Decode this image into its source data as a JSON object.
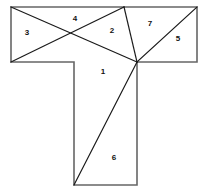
{
  "figure": {
    "width": 208,
    "height": 194,
    "background_color": "#ffffff",
    "outline_color": "#666666",
    "cut_line_color": "#1a1a1a",
    "label_color": "#111111"
  },
  "outline": {
    "name": "t-shape-outline",
    "points": "11,7 197,7 197,62 137,62 137,185 74,185 74,62 11,62"
  },
  "cuts": [
    {
      "name": "cut-topleft-to-hub",
      "x1": 11,
      "y1": 7,
      "x2": 137,
      "y2": 62
    },
    {
      "name": "cut-leftbottom-to-topvertex",
      "x1": 11,
      "y1": 62,
      "x2": 124,
      "y2": 7
    },
    {
      "name": "cut-topvertex-to-hub",
      "x1": 124,
      "y1": 7,
      "x2": 137,
      "y2": 62
    },
    {
      "name": "cut-hub-to-topright",
      "x1": 137,
      "y1": 62,
      "x2": 197,
      "y2": 7
    },
    {
      "name": "cut-hub-to-stem-bottomleft",
      "x1": 137,
      "y1": 62,
      "x2": 74,
      "y2": 185
    }
  ],
  "labels": [
    {
      "name": "piece-label-3",
      "text": "3",
      "x": 27,
      "y": 33
    },
    {
      "name": "piece-label-4",
      "text": "4",
      "x": 75,
      "y": 19
    },
    {
      "name": "piece-label-2",
      "text": "2",
      "x": 112,
      "y": 31
    },
    {
      "name": "piece-label-7",
      "text": "7",
      "x": 150,
      "y": 24
    },
    {
      "name": "piece-label-5",
      "text": "5",
      "x": 178,
      "y": 39
    },
    {
      "name": "piece-label-1",
      "text": "1",
      "x": 103,
      "y": 72
    },
    {
      "name": "piece-label-6",
      "text": "6",
      "x": 114,
      "y": 158
    }
  ]
}
